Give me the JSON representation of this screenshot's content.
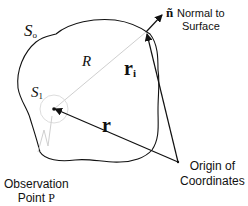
{
  "diagram": {
    "surface_outer_label": "S",
    "surface_outer_sub": "o",
    "surface_inner_label": "S",
    "surface_inner_sub": "1",
    "radius_label": "R",
    "vector_ri_label": "r",
    "vector_ri_sub": "i",
    "vector_r_label": "r",
    "normal_symbol": "ñ",
    "normal_label_line1": "Normal to",
    "normal_label_line2": "Surface",
    "origin_label_line1": "Origin of",
    "origin_label_line2": "Coordinates",
    "observation_label_line1": "Observation",
    "observation_label_line2": "Point",
    "observation_point_symbol": "P",
    "colors": {
      "ink": "#111111",
      "faint_line": "#cfcfcf"
    }
  }
}
